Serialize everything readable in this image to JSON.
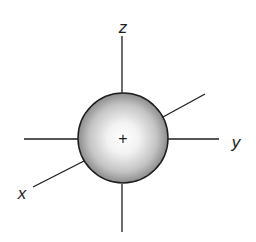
{
  "diagram": {
    "axes": {
      "x": {
        "label": "x"
      },
      "y": {
        "label": "y"
      },
      "z": {
        "label": "z"
      }
    },
    "nucleus_symbol": "+",
    "colors": {
      "line": "#1e1e1e",
      "sphere_highlight": "#ffffff",
      "sphere_shade": "#8c8c8c",
      "background": "#ffffff"
    }
  }
}
